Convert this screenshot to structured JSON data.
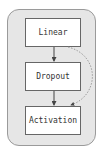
{
  "diagram": {
    "nodes": [
      {
        "id": "linear",
        "label": "Linear"
      },
      {
        "id": "dropout",
        "label": "Dropout"
      },
      {
        "id": "activation",
        "label": "Activation"
      }
    ],
    "edges": [
      {
        "from": "linear",
        "to": "dropout",
        "style": "solid"
      },
      {
        "from": "dropout",
        "to": "activation",
        "style": "solid"
      },
      {
        "from": "linear",
        "to": "activation",
        "style": "dotted"
      }
    ],
    "colors": {
      "container": "#e6e6e6",
      "node_fill": "#ffffff",
      "border": "#666666",
      "dotted_edge": "#888888"
    }
  }
}
